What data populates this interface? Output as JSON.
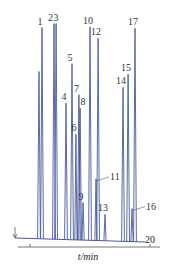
{
  "chart_data": {
    "type": "line",
    "title": "",
    "xlabel": "t/min",
    "ylabel": "",
    "x_ticks": [
      {
        "value": 0,
        "label": ""
      },
      {
        "value": 20,
        "label": "20"
      }
    ],
    "xlim": [
      -2,
      22
    ],
    "grid": false,
    "legend": null,
    "injection_marker": {
      "type": "arrow",
      "time": -2.5
    },
    "colors": {
      "trace": "#4a5a9a",
      "axis": "#555555",
      "text": "#333333"
    },
    "peaks": [
      {
        "label": "",
        "time": 1.5,
        "height": 0.76,
        "show_label": false
      },
      {
        "label": "1",
        "time": 2.0,
        "height": 0.96
      },
      {
        "label": "2",
        "time": 4.0,
        "height": 0.98
      },
      {
        "label": "3",
        "time": 4.35,
        "height": 0.98
      },
      {
        "label": "4",
        "time": 6.0,
        "height": 0.62
      },
      {
        "label": "5",
        "time": 7.0,
        "height": 0.8
      },
      {
        "label": "6",
        "time": 7.65,
        "height": 0.48
      },
      {
        "label": "7",
        "time": 8.15,
        "height": 0.66
      },
      {
        "label": "8",
        "time": 8.35,
        "height": 0.6
      },
      {
        "label": "9",
        "time": 8.85,
        "height": 0.17
      },
      {
        "label": "10",
        "time": 10.0,
        "height": 0.97
      },
      {
        "label": "11",
        "time": 11.0,
        "height": 0.28,
        "leader": true
      },
      {
        "label": "12",
        "time": 11.35,
        "height": 0.92
      },
      {
        "label": "13",
        "time": 12.5,
        "height": 0.12
      },
      {
        "label": "14",
        "time": 15.5,
        "height": 0.7
      },
      {
        "label": "15",
        "time": 16.35,
        "height": 0.76
      },
      {
        "label": "16",
        "time": 17.0,
        "height": 0.15,
        "leader": true
      },
      {
        "label": "17",
        "time": 17.5,
        "height": 0.97
      }
    ]
  }
}
